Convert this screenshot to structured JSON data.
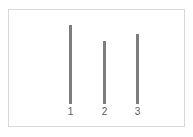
{
  "chart_data": {
    "type": "bar",
    "title": "",
    "subtitle": "",
    "xlabel": "",
    "ylabel": "",
    "categories": [
      "1",
      "2",
      "3"
    ],
    "values": [
      79,
      63,
      70
    ],
    "ylim": [
      0,
      94
    ],
    "grid": false,
    "legend": null,
    "legend_position": "none",
    "tick_labels_x": [
      "1",
      "2",
      "3"
    ],
    "tick_labels_y": [],
    "annotations": [],
    "bars": [
      {
        "category": "1",
        "value": 79,
        "x_px": 60,
        "width_px": 3,
        "color": "#7d7d7d"
      },
      {
        "category": "2",
        "value": 63,
        "x_px": 94,
        "width_px": 3,
        "color": "#7d7d7d"
      },
      {
        "category": "3",
        "value": 70,
        "x_px": 127,
        "width_px": 3,
        "color": "#7d7d7d"
      }
    ]
  },
  "figure": {
    "background_color": "#ffffff",
    "frame_color": "#d8d8d8",
    "bar_color": "#7d7d7d",
    "label_color": "#5a5a5a"
  }
}
